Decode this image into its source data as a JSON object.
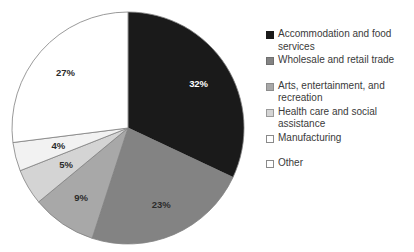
{
  "chart_data": {
    "type": "pie",
    "title": "",
    "legend_position": "right",
    "start_angle_deg": 0,
    "direction": "clockwise",
    "categories": [
      "Accommodation and food services",
      "Wholesale and retail trade",
      "Arts, entertainment, and recreation",
      "Health care and social assistance",
      "Manufacturing",
      "Other"
    ],
    "values": [
      32,
      23,
      9,
      5,
      4,
      27
    ],
    "data_labels": [
      "32%",
      "23%",
      "9%",
      "5%",
      "4%",
      "27%"
    ],
    "colors": [
      "#1a1a1a",
      "#838383",
      "#a8a8a8",
      "#d4d4d4",
      "#f2f2f2",
      "#ffffff"
    ],
    "slice_outline_color": "#808080",
    "label_text_colors": [
      "#ffffff",
      "#2b2b2b",
      "#2b2b2b",
      "#2b2b2b",
      "#2b2b2b",
      "#2b2b2b"
    ]
  },
  "legend": {
    "items": [
      {
        "label": "Accommodation and food\nservices",
        "color": "#1a1a1a",
        "border": "#1a1a1a"
      },
      {
        "label": "Wholesale and retail trade",
        "color": "#838383",
        "border": "#6f6f6f"
      },
      {
        "label": "Arts, entertainment, and\nrecreation",
        "color": "#a8a8a8",
        "border": "#8d8d8d"
      },
      {
        "label": "Health care and social\nassistance",
        "color": "#d4d4d4",
        "border": "#9a9a9a"
      },
      {
        "label": "Manufacturing",
        "color": "#ffffff",
        "border": "#8a8a8a"
      },
      {
        "label": "Other",
        "color": "#ffffff",
        "border": "#8a8a8a"
      }
    ]
  }
}
